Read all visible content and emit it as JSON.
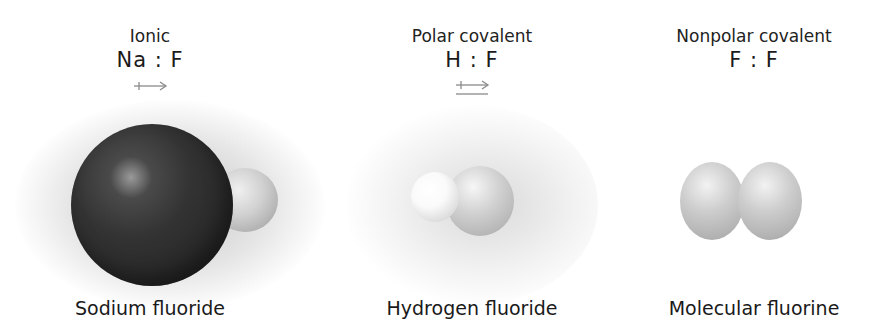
{
  "panels": [
    {
      "bond_type": "Ionic",
      "formula": "Na : F",
      "caption": "Sodium fluoride",
      "arrow": "double-headed-arrow"
    },
    {
      "bond_type": "Polar covalent",
      "formula": "H : F",
      "caption": "Hydrogen fluoride",
      "arrow": "double-headed-arrow-underlined"
    },
    {
      "bond_type": "Nonpolar covalent",
      "formula": "F : F",
      "caption": "Molecular fluorine",
      "arrow": "none"
    }
  ],
  "colors": {
    "sodium": "#2e2e2e",
    "fluorine": "#cfcfcf",
    "hydrogen": "#f4f4f4",
    "arrow": "#8a8a8a",
    "text": "#1a1a1a"
  }
}
